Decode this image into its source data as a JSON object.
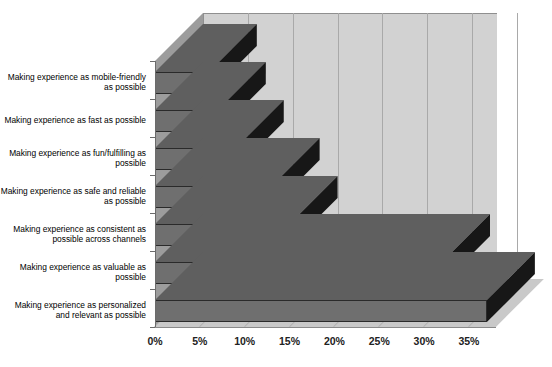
{
  "chart_data": {
    "type": "bar",
    "orientation": "horizontal",
    "style": "3d",
    "title": "",
    "subtitle": "",
    "xlabel": "",
    "ylabel": "",
    "grid": true,
    "legend": false,
    "xlim": [
      0,
      38
    ],
    "xticks": [
      "0%",
      "5%",
      "10%",
      "15%",
      "20%",
      "25%",
      "30%",
      "35%"
    ],
    "xtick_values": [
      0,
      5,
      10,
      15,
      20,
      25,
      30,
      35
    ],
    "categories": [
      "Making experience as mobile-friendly as possible",
      "Making experience as fast as possible",
      "Making experience as fun/fulfilling as possible",
      "Making experience as safe and reliable as possible",
      "Making experience as consistent as possible across channels",
      "Making experience as valuable as possible",
      "Making experience as personalized and relevant as possible"
    ],
    "values": [
      6,
      7,
      9,
      13,
      15,
      32,
      37
    ],
    "series": [
      {
        "name": "Share of respondents",
        "values": [
          6,
          7,
          9,
          13,
          15,
          32,
          37
        ]
      }
    ]
  },
  "colors": {
    "bar_front": "#6f6f6f",
    "bar_top": "#5f5f5f",
    "bar_side": "#171717",
    "back_wall": "#d2d2d2",
    "left_wall": "#9c9c9c",
    "floor": "#c9c9c9",
    "grid": "#a9a9a9",
    "text": "#000000",
    "background": "#ffffff"
  }
}
